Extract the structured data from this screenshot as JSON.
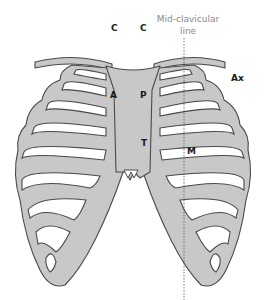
{
  "diagram": {
    "labels": {
      "c_left": "C",
      "c_right": "C",
      "mid_clavicular_line_1": "Mid-clavicular",
      "mid_clavicular_line_2": "line",
      "a": "A",
      "p": "P",
      "t": "T",
      "m": "M",
      "ax": "Ax"
    },
    "colors": {
      "bone_fill": "#c8c8c8",
      "bone_outline": "#4a4a4a",
      "label_text": "#1a1a1a",
      "mid_clavicular_text": "#8a8a8a",
      "mid_clavicular_line": "#555555",
      "background": "#ffffff"
    }
  }
}
